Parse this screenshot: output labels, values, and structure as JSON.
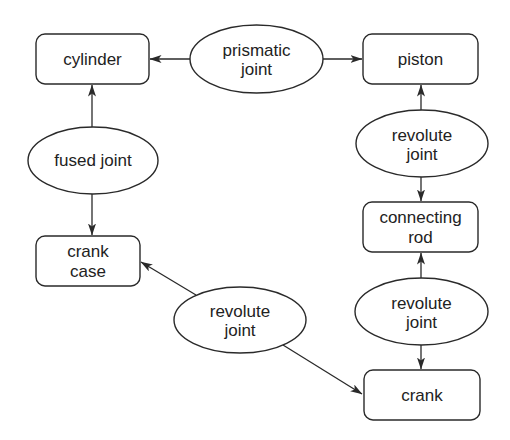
{
  "diagram": {
    "type": "mechanism-graph",
    "nodes": {
      "cylinder": {
        "label": [
          "cylinder"
        ],
        "shape": "rounded-rect"
      },
      "piston": {
        "label": [
          "piston"
        ],
        "shape": "rounded-rect"
      },
      "crank_case": {
        "label": [
          "crank",
          "case"
        ],
        "shape": "rounded-rect"
      },
      "connecting_rod": {
        "label": [
          "connecting",
          "rod"
        ],
        "shape": "rounded-rect"
      },
      "crank": {
        "label": [
          "crank"
        ],
        "shape": "rounded-rect"
      },
      "prismatic_joint": {
        "label": [
          "prismatic",
          "joint"
        ],
        "shape": "ellipse"
      },
      "fused_joint": {
        "label": [
          "fused joint"
        ],
        "shape": "ellipse"
      },
      "revolute_joint_top_right": {
        "label": [
          "revolute",
          "joint"
        ],
        "shape": "ellipse"
      },
      "revolute_joint_bottom_right": {
        "label": [
          "revolute",
          "joint"
        ],
        "shape": "ellipse"
      },
      "revolute_joint_middle": {
        "label": [
          "revolute",
          "joint"
        ],
        "shape": "ellipse"
      }
    },
    "edges": [
      {
        "from": "prismatic_joint",
        "to": "cylinder"
      },
      {
        "from": "prismatic_joint",
        "to": "piston"
      },
      {
        "from": "fused_joint",
        "to": "cylinder"
      },
      {
        "from": "fused_joint",
        "to": "crank_case"
      },
      {
        "from": "revolute_joint_top_right",
        "to": "piston"
      },
      {
        "from": "revolute_joint_top_right",
        "to": "connecting_rod"
      },
      {
        "from": "revolute_joint_bottom_right",
        "to": "connecting_rod"
      },
      {
        "from": "revolute_joint_bottom_right",
        "to": "crank"
      },
      {
        "from": "revolute_joint_middle",
        "to": "crank_case"
      },
      {
        "from": "revolute_joint_middle",
        "to": "crank"
      }
    ],
    "colors": {
      "stroke": "#2a2a2a",
      "text": "#222222",
      "background": "#ffffff"
    }
  }
}
